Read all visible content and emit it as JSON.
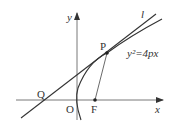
{
  "diagram": {
    "labels": {
      "y_axis": "y",
      "x_axis": "x",
      "origin": "O",
      "focus": "F",
      "point_p": "P",
      "point_q": "Q",
      "tangent_line": "l",
      "equation": "y²=4px"
    },
    "colors": {
      "stroke": "#333333",
      "background": "#ffffff"
    }
  }
}
